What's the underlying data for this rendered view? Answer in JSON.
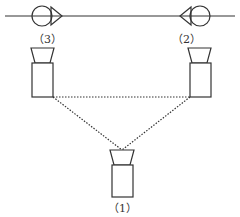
{
  "diagram": {
    "line_color": "#333333",
    "background": "#ffffff",
    "track": {
      "y": 16,
      "x1": 5,
      "x2": 235
    },
    "signals": [
      {
        "id": "signal-left",
        "direction": "right",
        "cx": 42,
        "cy": 16,
        "r": 10
      },
      {
        "id": "signal-right",
        "direction": "left",
        "cx": 199,
        "cy": 16,
        "r": 10
      }
    ],
    "cameras": [
      {
        "id": "camera-1",
        "label": "（1）"
      },
      {
        "id": "camera-2",
        "label": "（2）"
      },
      {
        "id": "camera-3",
        "label": "（3）"
      }
    ],
    "connections": "dotted triangle linking cameras (3), (2) and (1)"
  }
}
